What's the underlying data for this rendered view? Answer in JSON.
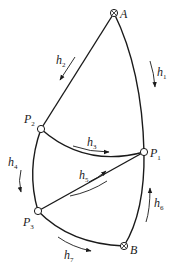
{
  "diagram": {
    "type": "directed-graph",
    "nodes": [
      {
        "id": "A",
        "label": "A",
        "sub": "",
        "marker": "crossed-circle"
      },
      {
        "id": "P1",
        "label": "P",
        "sub": "1",
        "marker": "open-circle"
      },
      {
        "id": "P2",
        "label": "P",
        "sub": "2",
        "marker": "open-circle"
      },
      {
        "id": "P3",
        "label": "P",
        "sub": "3",
        "marker": "open-circle"
      },
      {
        "id": "B",
        "label": "B",
        "sub": "",
        "marker": "crossed-circle"
      }
    ],
    "edges": [
      {
        "id": "h1",
        "label": "h",
        "sub": "1",
        "from": "A",
        "to": "P1",
        "flow": "A to P1"
      },
      {
        "id": "h2",
        "label": "h",
        "sub": "2",
        "from": "A",
        "to": "P2",
        "flow": "A to P2"
      },
      {
        "id": "h3",
        "label": "h",
        "sub": "3",
        "from": "P2",
        "to": "P1",
        "flow": "P2 to P1"
      },
      {
        "id": "h4",
        "label": "h",
        "sub": "4",
        "from": "P2",
        "to": "P3",
        "flow": "P2 to P3"
      },
      {
        "id": "h5",
        "label": "h",
        "sub": "5",
        "from": "P3",
        "to": "P1",
        "flow": "P3 to P1"
      },
      {
        "id": "h6",
        "label": "h",
        "sub": "6",
        "from": "B",
        "to": "P1",
        "flow": "B to P1"
      },
      {
        "id": "h7",
        "label": "h",
        "sub": "7",
        "from": "P3",
        "to": "B",
        "flow": "P3 to B"
      }
    ]
  }
}
